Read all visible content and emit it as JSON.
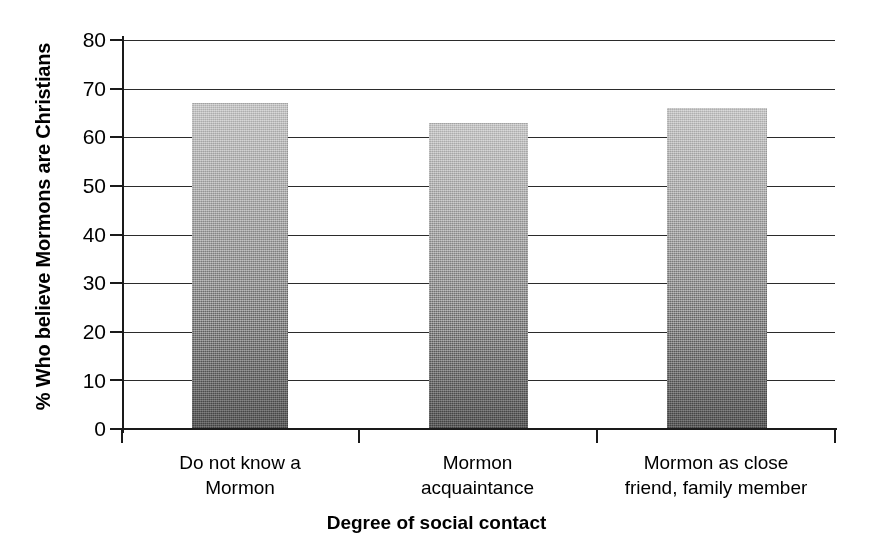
{
  "chart_data": {
    "type": "bar",
    "title": "",
    "subtitle": "",
    "xlabel": "Degree of social contact",
    "ylabel": "% Who believe Mormons are Christians",
    "categories": [
      "Do not know a\nMormon",
      "Mormon\nacquaintance",
      "Mormon as close\nfriend, family member"
    ],
    "category_lines": [
      [
        "Do not know a",
        "Mormon"
      ],
      [
        "Mormon",
        "acquaintance"
      ],
      [
        "Mormon as close",
        "friend, family member"
      ]
    ],
    "values": [
      67,
      63,
      66
    ],
    "ylim": [
      0,
      80
    ],
    "yticks": [
      0,
      10,
      20,
      30,
      40,
      50,
      60,
      70,
      80
    ],
    "ytick_labels": [
      "0",
      "10",
      "20",
      "30",
      "40",
      "50",
      "60",
      "70",
      "80"
    ],
    "grid": true,
    "grid_axis": "y",
    "legend": false,
    "legend_position": "none",
    "bar_fill": "gradient-gray",
    "colors": {
      "bar_top": "#c0c0c0",
      "bar_bottom": "#555555",
      "axis": "#1a1a1a",
      "grid": "#2b2b2b",
      "text": "#000000",
      "background": "#ffffff"
    }
  }
}
